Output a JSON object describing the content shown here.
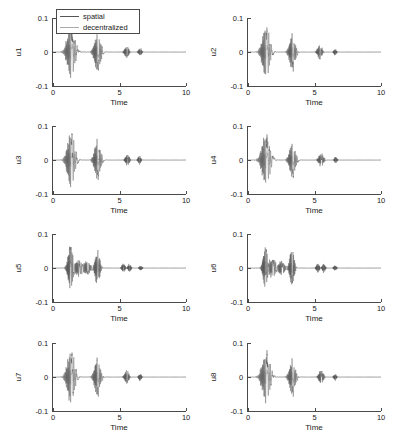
{
  "figure": {
    "type": "multi-panel-line-plot",
    "rows": 4,
    "cols": 2,
    "background": "#ffffff"
  },
  "legend": {
    "position": "top-center of first subplot",
    "entries": [
      {
        "label": "spatial",
        "color": "#555555"
      },
      {
        "label": "decentralized",
        "color": "#aaaaaa"
      }
    ]
  },
  "axes_common": {
    "xlabel": "Time",
    "xlim": [
      0,
      10
    ],
    "xticks": [
      "0",
      "5",
      "10"
    ],
    "xtick_values": [
      0,
      5,
      10
    ],
    "ylim": [
      -0.1,
      0.1
    ],
    "yticks": [
      "0.1",
      "0",
      "-0.1"
    ],
    "ytick_values": [
      0.1,
      0,
      -0.1
    ],
    "grid": false,
    "axis_color": "#4a4a4a"
  },
  "chart_data": [
    {
      "type": "line",
      "title": "",
      "ylabel": "u1",
      "xlabel": "Time",
      "xlim": [
        0,
        10
      ],
      "ylim": [
        -0.1,
        0.1
      ],
      "grid": false,
      "series": [
        {
          "name": "spatial",
          "color": "#555555",
          "description": "damped oscillatory bursts",
          "bursts": [
            {
              "center": 1.35,
              "amplitude": 0.072,
              "width": 0.58,
              "freq": 30
            },
            {
              "center": 3.35,
              "amplitude": 0.055,
              "width": 0.45,
              "freq": 30
            },
            {
              "center": 5.55,
              "amplitude": 0.017,
              "width": 0.3,
              "freq": 30
            },
            {
              "center": 6.55,
              "amplitude": 0.011,
              "width": 0.22,
              "freq": 30
            }
          ]
        },
        {
          "name": "decentralized",
          "color": "#aaaaaa",
          "description": "lower amplitude damped oscillatory bursts",
          "bursts": [
            {
              "center": 1.35,
              "amplitude": 0.022,
              "width": 0.6,
              "freq": 26
            },
            {
              "center": 3.35,
              "amplitude": 0.016,
              "width": 0.5,
              "freq": 26
            },
            {
              "center": 5.55,
              "amplitude": 0.008,
              "width": 0.32,
              "freq": 26
            },
            {
              "center": 6.55,
              "amplitude": 0.005,
              "width": 0.24,
              "freq": 26
            }
          ]
        }
      ]
    },
    {
      "type": "line",
      "title": "",
      "ylabel": "u2",
      "xlabel": "Time",
      "xlim": [
        0,
        10
      ],
      "ylim": [
        -0.1,
        0.1
      ],
      "grid": false,
      "series": [
        {
          "name": "spatial",
          "color": "#555555",
          "bursts": [
            {
              "center": 1.35,
              "amplitude": 0.07,
              "width": 0.55,
              "freq": 30
            },
            {
              "center": 3.35,
              "amplitude": 0.052,
              "width": 0.42,
              "freq": 30
            },
            {
              "center": 5.4,
              "amplitude": 0.02,
              "width": 0.33,
              "freq": 30
            },
            {
              "center": 6.55,
              "amplitude": 0.01,
              "width": 0.18,
              "freq": 30
            }
          ]
        },
        {
          "name": "decentralized",
          "color": "#aaaaaa",
          "bursts": [
            {
              "center": 1.35,
              "amplitude": 0.02,
              "width": 0.58,
              "freq": 26
            },
            {
              "center": 3.35,
              "amplitude": 0.014,
              "width": 0.46,
              "freq": 26
            },
            {
              "center": 5.4,
              "amplitude": 0.009,
              "width": 0.35,
              "freq": 26
            },
            {
              "center": 6.55,
              "amplitude": 0.004,
              "width": 0.2,
              "freq": 26
            }
          ]
        }
      ]
    },
    {
      "type": "line",
      "title": "",
      "ylabel": "u3",
      "xlabel": "Time",
      "xlim": [
        0,
        10
      ],
      "ylim": [
        -0.1,
        0.1
      ],
      "grid": false,
      "series": [
        {
          "name": "spatial",
          "color": "#555555",
          "bursts": [
            {
              "center": 1.35,
              "amplitude": 0.074,
              "width": 0.55,
              "freq": 30
            },
            {
              "center": 3.35,
              "amplitude": 0.056,
              "width": 0.44,
              "freq": 30
            },
            {
              "center": 5.6,
              "amplitude": 0.018,
              "width": 0.28,
              "freq": 30
            },
            {
              "center": 6.5,
              "amplitude": 0.012,
              "width": 0.2,
              "freq": 30
            }
          ]
        },
        {
          "name": "decentralized",
          "color": "#aaaaaa",
          "bursts": [
            {
              "center": 1.35,
              "amplitude": 0.021,
              "width": 0.58,
              "freq": 26
            },
            {
              "center": 3.35,
              "amplitude": 0.015,
              "width": 0.48,
              "freq": 26
            },
            {
              "center": 5.6,
              "amplitude": 0.008,
              "width": 0.3,
              "freq": 26
            },
            {
              "center": 6.5,
              "amplitude": 0.005,
              "width": 0.22,
              "freq": 26
            }
          ]
        }
      ]
    },
    {
      "type": "line",
      "title": "",
      "ylabel": "u4",
      "xlabel": "Time",
      "xlim": [
        0,
        10
      ],
      "ylim": [
        -0.1,
        0.1
      ],
      "grid": false,
      "series": [
        {
          "name": "spatial",
          "color": "#555555",
          "bursts": [
            {
              "center": 1.35,
              "amplitude": 0.068,
              "width": 0.6,
              "freq": 30
            },
            {
              "center": 3.35,
              "amplitude": 0.05,
              "width": 0.44,
              "freq": 30
            },
            {
              "center": 5.5,
              "amplitude": 0.019,
              "width": 0.34,
              "freq": 30
            },
            {
              "center": 6.6,
              "amplitude": 0.01,
              "width": 0.18,
              "freq": 30
            }
          ]
        },
        {
          "name": "decentralized",
          "color": "#aaaaaa",
          "bursts": [
            {
              "center": 1.35,
              "amplitude": 0.022,
              "width": 0.62,
              "freq": 26
            },
            {
              "center": 3.35,
              "amplitude": 0.014,
              "width": 0.48,
              "freq": 26
            },
            {
              "center": 5.5,
              "amplitude": 0.009,
              "width": 0.36,
              "freq": 26
            },
            {
              "center": 6.6,
              "amplitude": 0.004,
              "width": 0.2,
              "freq": 26
            }
          ]
        }
      ]
    },
    {
      "type": "line",
      "title": "",
      "ylabel": "u5",
      "xlabel": "Time",
      "xlim": [
        0,
        10
      ],
      "ylim": [
        -0.1,
        0.1
      ],
      "grid": false,
      "series": [
        {
          "name": "spatial",
          "color": "#555555",
          "bursts": [
            {
              "center": 1.3,
              "amplitude": 0.06,
              "width": 0.35,
              "freq": 32
            },
            {
              "center": 1.95,
              "amplitude": 0.026,
              "width": 0.45,
              "freq": 32
            },
            {
              "center": 2.6,
              "amplitude": 0.022,
              "width": 0.4,
              "freq": 32
            },
            {
              "center": 3.35,
              "amplitude": 0.05,
              "width": 0.35,
              "freq": 32
            },
            {
              "center": 5.3,
              "amplitude": 0.014,
              "width": 0.22,
              "freq": 32
            },
            {
              "center": 5.75,
              "amplitude": 0.012,
              "width": 0.2,
              "freq": 32
            },
            {
              "center": 6.6,
              "amplitude": 0.008,
              "width": 0.18,
              "freq": 32
            }
          ]
        },
        {
          "name": "decentralized",
          "color": "#aaaaaa",
          "bursts": [
            {
              "center": 1.3,
              "amplitude": 0.02,
              "width": 0.38,
              "freq": 28
            },
            {
              "center": 1.95,
              "amplitude": 0.016,
              "width": 0.48,
              "freq": 28
            },
            {
              "center": 2.6,
              "amplitude": 0.013,
              "width": 0.42,
              "freq": 28
            },
            {
              "center": 3.35,
              "amplitude": 0.016,
              "width": 0.38,
              "freq": 28
            },
            {
              "center": 5.3,
              "amplitude": 0.007,
              "width": 0.24,
              "freq": 28
            },
            {
              "center": 5.75,
              "amplitude": 0.006,
              "width": 0.22,
              "freq": 28
            },
            {
              "center": 6.6,
              "amplitude": 0.004,
              "width": 0.2,
              "freq": 28
            }
          ]
        }
      ]
    },
    {
      "type": "line",
      "title": "",
      "ylabel": "u6",
      "xlabel": "Time",
      "xlim": [
        0,
        10
      ],
      "ylim": [
        -0.1,
        0.1
      ],
      "grid": false,
      "series": [
        {
          "name": "spatial",
          "color": "#555555",
          "bursts": [
            {
              "center": 1.3,
              "amplitude": 0.062,
              "width": 0.32,
              "freq": 32
            },
            {
              "center": 1.85,
              "amplitude": 0.028,
              "width": 0.42,
              "freq": 32
            },
            {
              "center": 2.55,
              "amplitude": 0.022,
              "width": 0.42,
              "freq": 32
            },
            {
              "center": 3.3,
              "amplitude": 0.054,
              "width": 0.32,
              "freq": 32
            },
            {
              "center": 5.25,
              "amplitude": 0.015,
              "width": 0.2,
              "freq": 32
            },
            {
              "center": 5.7,
              "amplitude": 0.013,
              "width": 0.2,
              "freq": 32
            },
            {
              "center": 6.55,
              "amplitude": 0.009,
              "width": 0.18,
              "freq": 32
            }
          ]
        },
        {
          "name": "decentralized",
          "color": "#aaaaaa",
          "bursts": [
            {
              "center": 1.3,
              "amplitude": 0.021,
              "width": 0.36,
              "freq": 28
            },
            {
              "center": 1.85,
              "amplitude": 0.017,
              "width": 0.46,
              "freq": 28
            },
            {
              "center": 2.55,
              "amplitude": 0.013,
              "width": 0.44,
              "freq": 28
            },
            {
              "center": 3.3,
              "amplitude": 0.017,
              "width": 0.36,
              "freq": 28
            },
            {
              "center": 5.25,
              "amplitude": 0.007,
              "width": 0.22,
              "freq": 28
            },
            {
              "center": 5.7,
              "amplitude": 0.006,
              "width": 0.22,
              "freq": 28
            },
            {
              "center": 6.55,
              "amplitude": 0.004,
              "width": 0.2,
              "freq": 28
            }
          ]
        }
      ]
    },
    {
      "type": "line",
      "title": "",
      "ylabel": "u7",
      "xlabel": "Time",
      "xlim": [
        0,
        10
      ],
      "ylim": [
        -0.1,
        0.1
      ],
      "grid": false,
      "series": [
        {
          "name": "spatial",
          "color": "#555555",
          "bursts": [
            {
              "center": 1.35,
              "amplitude": 0.073,
              "width": 0.55,
              "freq": 30
            },
            {
              "center": 3.35,
              "amplitude": 0.057,
              "width": 0.42,
              "freq": 30
            },
            {
              "center": 5.55,
              "amplitude": 0.02,
              "width": 0.3,
              "freq": 30
            },
            {
              "center": 6.55,
              "amplitude": 0.012,
              "width": 0.18,
              "freq": 30
            }
          ]
        },
        {
          "name": "decentralized",
          "color": "#aaaaaa",
          "bursts": [
            {
              "center": 1.35,
              "amplitude": 0.02,
              "width": 0.58,
              "freq": 26
            },
            {
              "center": 3.35,
              "amplitude": 0.015,
              "width": 0.46,
              "freq": 26
            },
            {
              "center": 5.55,
              "amplitude": 0.008,
              "width": 0.32,
              "freq": 26
            },
            {
              "center": 6.55,
              "amplitude": 0.005,
              "width": 0.2,
              "freq": 26
            }
          ]
        }
      ]
    },
    {
      "type": "line",
      "title": "",
      "ylabel": "u8",
      "xlabel": "Time",
      "xlim": [
        0,
        10
      ],
      "ylim": [
        -0.1,
        0.1
      ],
      "grid": false,
      "series": [
        {
          "name": "spatial",
          "color": "#555555",
          "bursts": [
            {
              "center": 1.35,
              "amplitude": 0.07,
              "width": 0.58,
              "freq": 30
            },
            {
              "center": 3.35,
              "amplitude": 0.053,
              "width": 0.42,
              "freq": 30
            },
            {
              "center": 5.5,
              "amplitude": 0.021,
              "width": 0.32,
              "freq": 30
            },
            {
              "center": 6.55,
              "amplitude": 0.01,
              "width": 0.18,
              "freq": 30
            }
          ]
        },
        {
          "name": "decentralized",
          "color": "#aaaaaa",
          "bursts": [
            {
              "center": 1.35,
              "amplitude": 0.021,
              "width": 0.6,
              "freq": 26
            },
            {
              "center": 3.35,
              "amplitude": 0.014,
              "width": 0.46,
              "freq": 26
            },
            {
              "center": 5.5,
              "amplitude": 0.009,
              "width": 0.34,
              "freq": 26
            },
            {
              "center": 6.55,
              "amplitude": 0.004,
              "width": 0.2,
              "freq": 26
            }
          ]
        }
      ]
    }
  ]
}
